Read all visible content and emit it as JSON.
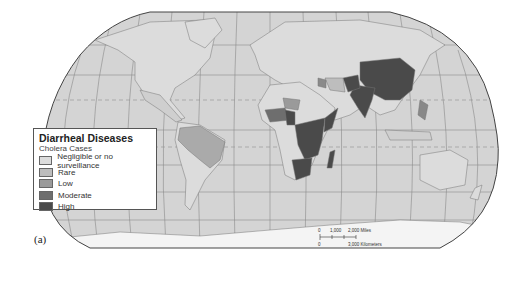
{
  "legend": {
    "title": "Diarrheal Diseases",
    "subtitle": "Cholera Cases",
    "items": [
      {
        "label": "Negligible or no surveillance",
        "color": "#dcdcdc"
      },
      {
        "label": "Rare",
        "color": "#bdbdbd"
      },
      {
        "label": "Low",
        "color": "#9a9a9a"
      },
      {
        "label": "Moderate",
        "color": "#6e6e6e"
      },
      {
        "label": "High",
        "color": "#4a4a4a"
      }
    ]
  },
  "scale_bar": {
    "miles_labels": [
      "0",
      "1,000",
      "2,000 Miles"
    ],
    "km_labels": [
      "0",
      "3,000 Kilometers"
    ]
  },
  "panel_label": "(a)",
  "colors": {
    "ocean": "#d4d4d4",
    "land_default": "#dcdcdc",
    "antarctica": "#f4f4f4",
    "graticule": "#8a8a8a",
    "outline": "#444444"
  }
}
